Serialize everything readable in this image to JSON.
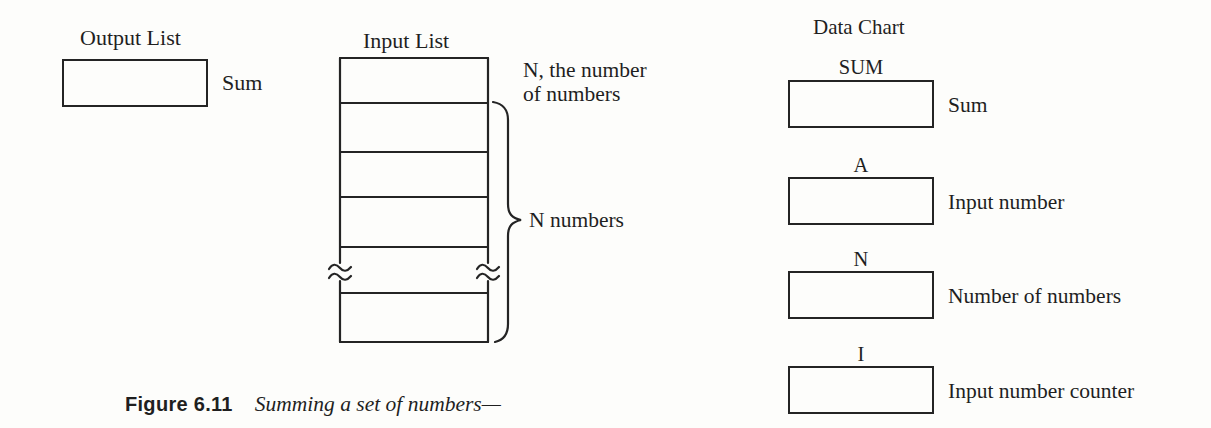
{
  "palette": {
    "paper": "#fdfdfb",
    "ink": "#1f1f1f"
  },
  "output_list": {
    "title": "Output List",
    "box_label": "Sum"
  },
  "input_list": {
    "title": "Input List",
    "top_cell_annotation_line1": "N, the number",
    "top_cell_annotation_line2": "of numbers",
    "brace_label": "N numbers",
    "cell_count_shown": 7
  },
  "data_chart": {
    "title": "Data Chart",
    "entries": [
      {
        "name": "SUM",
        "description": "Sum"
      },
      {
        "name": "A",
        "description": "Input number"
      },
      {
        "name": "N",
        "description": "Number of numbers"
      },
      {
        "name": "I",
        "description": "Input number counter"
      }
    ]
  },
  "caption": {
    "figure_label": "Figure 6.11",
    "text": "Summing a set of numbers—"
  }
}
